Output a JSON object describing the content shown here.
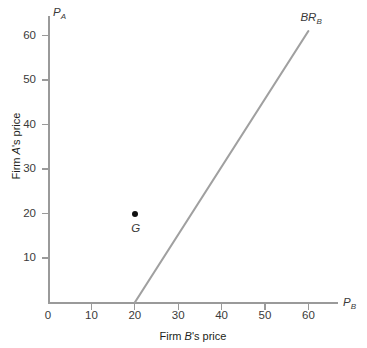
{
  "chart_data": {
    "type": "line",
    "title": "",
    "xlabel": "Firm B's price",
    "ylabel": "Firm A's price",
    "x_axis_symbol": "P",
    "x_axis_subscript": "B",
    "y_axis_symbol": "P",
    "y_axis_subscript": "A",
    "xlim": [
      0,
      67
    ],
    "ylim": [
      0,
      65
    ],
    "xticks": [
      0,
      10,
      20,
      30,
      40,
      50,
      60
    ],
    "yticks": [
      10,
      20,
      30,
      40,
      50,
      60
    ],
    "xtick_labels": [
      "0",
      "10",
      "20",
      "30",
      "40",
      "50",
      "60"
    ],
    "ytick_labels": [
      "10",
      "20",
      "30",
      "40",
      "50",
      "60"
    ],
    "grid": false,
    "legend": "none",
    "series": [
      {
        "name": "BR_B",
        "label_text": "BR",
        "label_subscript": "B",
        "type": "line",
        "color": "#a0a0a0",
        "x": [
          20,
          60
        ],
        "y": [
          0,
          61
        ]
      }
    ],
    "points": [
      {
        "name": "G",
        "label": "G",
        "x": 20,
        "y": 20,
        "color": "#111111"
      }
    ],
    "annotations": [
      {
        "text": "BR",
        "subscript": "B",
        "x": 60,
        "y": 65
      },
      {
        "text": "G",
        "x": 20,
        "y": 16
      }
    ]
  },
  "colors": {
    "axis": "#9a9a9a",
    "line": "#a0a0a0",
    "point": "#111111",
    "text": "#3a3a3a",
    "background": "#ffffff"
  }
}
